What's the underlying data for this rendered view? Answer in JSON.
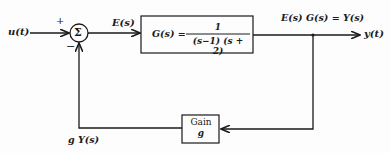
{
  "diagram": {
    "input_label": "u(t)",
    "plus_sign": "+",
    "minus_sign": "−",
    "sum_symbol": "Σ",
    "error_label": "E(s)",
    "plant": {
      "lhs": "G(s) =",
      "numerator": "1",
      "denominator": "(s−1)  (s + 2)"
    },
    "output_expr": "E(s)  G(s) = Y(s)",
    "output_label": "y(t)",
    "feedback": {
      "block_title": "Gain",
      "block_symbol": "g",
      "signal_label": "g Y(s)"
    }
  }
}
